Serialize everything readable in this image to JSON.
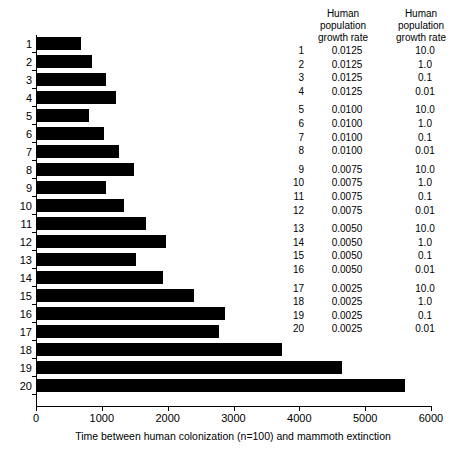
{
  "chart_data": {
    "type": "bar",
    "orientation": "horizontal",
    "title": "",
    "xlabel": "Time between human colonization (n=100) and mammoth extinction",
    "ylabel": "",
    "xlim": [
      0,
      6000
    ],
    "xticks": [
      0,
      1000,
      2000,
      3000,
      4000,
      5000,
      6000
    ],
    "xticklabels": [
      "0",
      "1000",
      "2000",
      "3000",
      "4000",
      "5000",
      "6000"
    ],
    "grid": false,
    "legend_position": "right-table",
    "bar_color": "#000000",
    "categories": [
      "1",
      "2",
      "3",
      "4",
      "5",
      "6",
      "7",
      "8",
      "9",
      "10",
      "11",
      "12",
      "13",
      "14",
      "15",
      "16",
      "17",
      "18",
      "19",
      "20"
    ],
    "values": [
      684,
      851,
      1064,
      1216,
      806,
      1033,
      1261,
      1489,
      1064,
      1337,
      1671,
      1975,
      1520,
      1930,
      2401,
      2872,
      2781,
      3739,
      4651,
      5608
    ]
  },
  "legend_table": {
    "header": {
      "index_label": "",
      "col1_lines": [
        "Human",
        "population",
        "growth rate"
      ],
      "col2_lines": [
        "Human",
        "population",
        "growth rate"
      ]
    },
    "rows": [
      {
        "index": "1",
        "col1": "0.0125",
        "col2": "10.0",
        "group_gap": false
      },
      {
        "index": "2",
        "col1": "0.0125",
        "col2": "1.0",
        "group_gap": false
      },
      {
        "index": "3",
        "col1": "0.0125",
        "col2": "0.1",
        "group_gap": false
      },
      {
        "index": "4",
        "col1": "0.0125",
        "col2": "0.01",
        "group_gap": false
      },
      {
        "index": "5",
        "col1": "0.0100",
        "col2": "10.0",
        "group_gap": true
      },
      {
        "index": "6",
        "col1": "0.0100",
        "col2": "1.0",
        "group_gap": false
      },
      {
        "index": "7",
        "col1": "0.0100",
        "col2": "0.1",
        "group_gap": false
      },
      {
        "index": "8",
        "col1": "0.0100",
        "col2": "0.01",
        "group_gap": false
      },
      {
        "index": "9",
        "col1": "0.0075",
        "col2": "10.0",
        "group_gap": true
      },
      {
        "index": "10",
        "col1": "0.0075",
        "col2": "1.0",
        "group_gap": false
      },
      {
        "index": "11",
        "col1": "0.0075",
        "col2": "0.1",
        "group_gap": false
      },
      {
        "index": "12",
        "col1": "0.0075",
        "col2": "0.01",
        "group_gap": false
      },
      {
        "index": "13",
        "col1": "0.0050",
        "col2": "10.0",
        "group_gap": true
      },
      {
        "index": "14",
        "col1": "0.0050",
        "col2": "1.0",
        "group_gap": false
      },
      {
        "index": "15",
        "col1": "0.0050",
        "col2": "0.1",
        "group_gap": false
      },
      {
        "index": "16",
        "col1": "0.0050",
        "col2": "0.01",
        "group_gap": false
      },
      {
        "index": "17",
        "col1": "0.0025",
        "col2": "10.0",
        "group_gap": true
      },
      {
        "index": "18",
        "col1": "0.0025",
        "col2": "1.0",
        "group_gap": false
      },
      {
        "index": "19",
        "col1": "0.0025",
        "col2": "0.1",
        "group_gap": false
      },
      {
        "index": "20",
        "col1": "0.0025",
        "col2": "0.01",
        "group_gap": false
      }
    ]
  }
}
